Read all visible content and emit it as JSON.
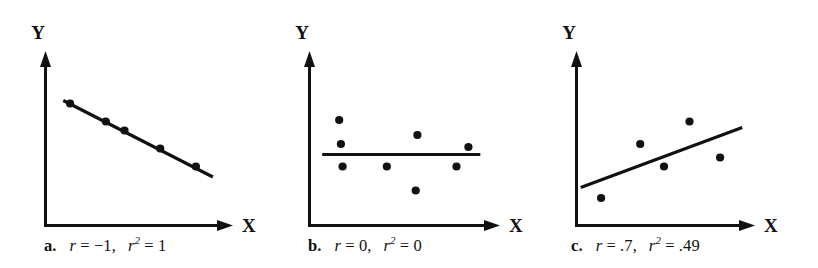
{
  "figure": {
    "background_color": "#ffffff",
    "ink_color": "#111111"
  },
  "chart_data": [
    {
      "type": "scatter",
      "panel_id": "a",
      "panel_letter": "a.",
      "title": "",
      "xlabel": "X",
      "ylabel": "Y",
      "grid": false,
      "legend": "none",
      "xlim": [
        0,
        100
      ],
      "ylim": [
        0,
        100
      ],
      "annotations": {
        "r_symbol": "r",
        "r_equals": " = ",
        "r_value": "−1",
        "comma": ",",
        "r2_symbol": "r",
        "r2_exponent": "2",
        "r2_value": "1",
        "caption_full": "a.  r = −1,  r² = 1"
      },
      "points": [
        {
          "x": 13,
          "y": 79
        },
        {
          "x": 34,
          "y": 67
        },
        {
          "x": 45,
          "y": 61
        },
        {
          "x": 66,
          "y": 49
        },
        {
          "x": 87,
          "y": 37
        }
      ],
      "fit_line": {
        "x0": 9,
        "y0": 81,
        "x1": 97,
        "y1": 30,
        "style": "solid"
      }
    },
    {
      "type": "scatter",
      "panel_id": "b",
      "panel_letter": "b.",
      "title": "",
      "xlabel": "X",
      "ylabel": "Y",
      "grid": false,
      "legend": "none",
      "xlim": [
        0,
        100
      ],
      "ylim": [
        0,
        100
      ],
      "annotations": {
        "r_symbol": "r",
        "r_equals": " = ",
        "r_value": "0",
        "comma": ",",
        "r2_symbol": "r",
        "r2_exponent": "2",
        "r2_value": "0",
        "caption_full": "b.  r = 0,  r² = 0"
      },
      "points": [
        {
          "x": 16,
          "y": 68
        },
        {
          "x": 17,
          "y": 52
        },
        {
          "x": 18,
          "y": 37
        },
        {
          "x": 44,
          "y": 37
        },
        {
          "x": 62,
          "y": 58
        },
        {
          "x": 61,
          "y": 21
        },
        {
          "x": 85,
          "y": 37
        },
        {
          "x": 92,
          "y": 50
        }
      ],
      "fit_line": {
        "x0": 6,
        "y0": 45,
        "x1": 99,
        "y1": 45,
        "style": "solid"
      }
    },
    {
      "type": "scatter",
      "panel_id": "c",
      "panel_letter": "c.",
      "title": "",
      "xlabel": "X",
      "ylabel": "Y",
      "grid": false,
      "legend": "none",
      "xlim": [
        0,
        100
      ],
      "ylim": [
        0,
        100
      ],
      "annotations": {
        "r_symbol": "r",
        "r_equals": " = ",
        "r_value": ".7",
        "comma": ",",
        "r2_symbol": "r",
        "r2_exponent": "2",
        "r2_value": ".49",
        "caption_full": "c.  r = .7,  r² = .49"
      },
      "points": [
        {
          "x": 13,
          "y": 16
        },
        {
          "x": 36,
          "y": 52
        },
        {
          "x": 50,
          "y": 37
        },
        {
          "x": 65,
          "y": 67
        },
        {
          "x": 83,
          "y": 43
        }
      ],
      "fit_line": {
        "x0": 1,
        "y0": 23,
        "x1": 96,
        "y1": 63,
        "style": "solid"
      }
    }
  ]
}
